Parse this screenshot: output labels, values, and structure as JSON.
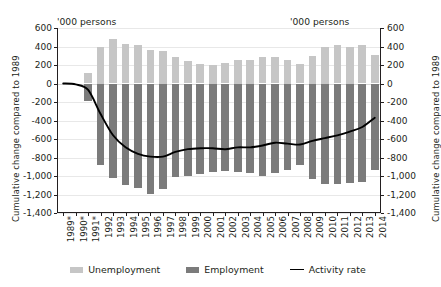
{
  "axis_titles": {
    "left": "Cumulative change compared to 1989",
    "right": "Cumulative change compared to 1989"
  },
  "units": {
    "left": "'000 persons",
    "right": "'000 persons"
  },
  "legend": {
    "unemployment": "Unemployment",
    "employment": "Employment",
    "activity_rate": "Activity rate"
  },
  "colors": {
    "unemployment": "#c6c6c6",
    "employment": "#7b7b7b",
    "activity_rate": "#000000",
    "grid": "#e8e8e8",
    "axis": "#231f20",
    "background": "#ffffff"
  },
  "chart_data": {
    "type": "bar",
    "title": "",
    "subtitle": "",
    "xlabel": "",
    "ylabel": "Cumulative change compared to 1989",
    "y_unit": "'000 persons",
    "ylim": [
      -1400,
      600
    ],
    "yticks": [
      600,
      400,
      200,
      0,
      -200,
      -400,
      -600,
      -800,
      -1000,
      -1200,
      -1400
    ],
    "ytick_labels": [
      "600",
      "400",
      "200",
      "0",
      "-200",
      "-400",
      "-600",
      "-800",
      "-1,000",
      "-1,200",
      "-1,400"
    ],
    "grid": true,
    "legend_position": "bottom",
    "stacked": false,
    "categories": [
      "1989*",
      "1990*",
      "1991*",
      "1992",
      "1993",
      "1994",
      "1995",
      "1996",
      "1997",
      "1998",
      "1999",
      "2000",
      "2001",
      "2002",
      "2003",
      "2004",
      "2005",
      "2006",
      "2007",
      "2008",
      "2009",
      "2010",
      "2011",
      "2012",
      "2013",
      "2014"
    ],
    "series": [
      {
        "name": "Unemployment",
        "type": "bar",
        "color": "#c6c6c6",
        "values": [
          0,
          0,
          110,
          400,
          480,
          430,
          420,
          360,
          350,
          290,
          240,
          210,
          200,
          220,
          250,
          250,
          290,
          290,
          250,
          210,
          300,
          400,
          420,
          400,
          420,
          310
        ]
      },
      {
        "name": "Employment",
        "type": "bar",
        "color": "#7b7b7b",
        "values": [
          0,
          0,
          -190,
          -880,
          -1020,
          -1100,
          -1130,
          -1190,
          -1140,
          -1010,
          -1000,
          -980,
          -960,
          -950,
          -960,
          -970,
          -1000,
          -970,
          -930,
          -880,
          -1030,
          -1090,
          -1090,
          -1080,
          -1060,
          -930
        ]
      },
      {
        "name": "Activity rate",
        "type": "line",
        "color": "#000000",
        "values": [
          0,
          -10,
          -70,
          -330,
          -560,
          -690,
          -760,
          -790,
          -790,
          -740,
          -710,
          -700,
          -700,
          -710,
          -690,
          -690,
          -670,
          -640,
          -650,
          -660,
          -620,
          -590,
          -560,
          -520,
          -470,
          -370
        ]
      }
    ]
  }
}
